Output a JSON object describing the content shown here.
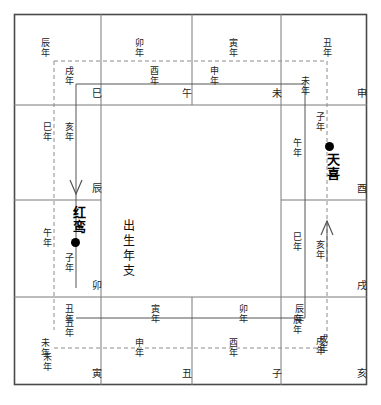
{
  "diagram": {
    "title_center": "出生年支",
    "stars": [
      {
        "name": "红鸾",
        "side": "left"
      },
      {
        "name": "天喜",
        "side": "right"
      }
    ],
    "palace_labels": {
      "si": "巳",
      "wu": "午",
      "wei": "未",
      "shen": "申",
      "you": "酉",
      "xu": "戌",
      "hai": "亥",
      "zi": "子",
      "chou": "丑",
      "yin": "寅",
      "mao": "卯",
      "chen": "辰"
    },
    "year_labels": {
      "top_dashed": [
        "辰年",
        "卯年",
        "寅年",
        "丑年"
      ],
      "top_solid": [
        "戌年",
        "酉年",
        "申年",
        "未年"
      ],
      "left_dashed": [
        "巳年",
        "午年",
        "未年"
      ],
      "left_solid": [
        "亥年",
        "子年",
        "丑年"
      ],
      "right_solid": [
        "午年",
        "巳年",
        "辰年"
      ],
      "right_dashed": [
        "子年",
        "亥年",
        "戌年"
      ],
      "bottom_solid": [
        "丑年",
        "寅年",
        "卯年",
        "辰年"
      ],
      "bottom_dashed": [
        "未年",
        "申年",
        "酉年",
        "戌年"
      ]
    },
    "colors": {
      "ink": "#1d1d1d",
      "rule": "#6e6e6e",
      "outer": "#4a4a4a",
      "dot": "#000000",
      "background": "#ffffff"
    },
    "arrows": [
      {
        "name": "left-down-arrow",
        "direction": "down"
      },
      {
        "name": "right-up-arrow",
        "direction": "up"
      }
    ]
  }
}
